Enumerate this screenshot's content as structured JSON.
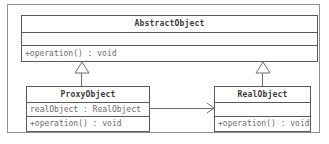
{
  "diagram": {
    "type": "uml-class-diagram",
    "classes": [
      {
        "id": "abstractobject",
        "name": "AbstractObject",
        "attributes": [],
        "operations": [
          "+operation() : void"
        ]
      },
      {
        "id": "proxyobject",
        "name": "ProxyObject",
        "attributes": [
          "realObject : RealObject"
        ],
        "operations": [
          "+operation() : void"
        ]
      },
      {
        "id": "realobject",
        "name": "RealObject",
        "attributes": [],
        "operations": [
          "+operation() : void"
        ]
      }
    ],
    "relationships": [
      {
        "id": "gen-proxy",
        "kind": "generalization",
        "from": "ProxyObject",
        "to": "AbstractObject",
        "arrow": "hollow-triangle"
      },
      {
        "id": "gen-real",
        "kind": "generalization",
        "from": "RealObject",
        "to": "AbstractObject",
        "arrow": "hollow-triangle"
      },
      {
        "id": "assoc-proxy-real",
        "kind": "association",
        "from": "ProxyObject",
        "to": "RealObject",
        "arrow": "open-arrow"
      }
    ],
    "colors": {
      "background": "#ffffff",
      "border": "#5a5a5a",
      "frame": "#8f8f8f",
      "connector": "#6e6e6e",
      "name_text": "#3b3b3b",
      "member_text": "#6b6b6b"
    }
  }
}
